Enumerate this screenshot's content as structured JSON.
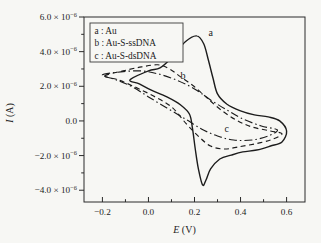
{
  "colors": {
    "ink": "#1c1c1c",
    "frame": "#2a2a2a",
    "background": "#f7f7f4",
    "legend_border": "#3a3a3a"
  },
  "chart_data": {
    "type": "line",
    "subtype": "cyclic-voltammogram",
    "title": "",
    "xlabel": {
      "var": "E",
      "unit": " (V)"
    },
    "ylabel": {
      "var": "I",
      "unit": " (A)"
    },
    "grid": false,
    "series_value_units": "1e-6 A",
    "xlim": [
      -0.28,
      0.68
    ],
    "ylim": [
      -4.68,
      6.0
    ],
    "x_ticks": {
      "values": [
        -0.2,
        0.0,
        0.2,
        0.4,
        0.6
      ],
      "labels": [
        "−0.2",
        "0.0",
        "0.2",
        "0.4",
        "0.6"
      ],
      "minor": [
        -0.1,
        0.1,
        0.3,
        0.5
      ]
    },
    "y_ticks": {
      "values": [
        6,
        4,
        2,
        0,
        -2,
        -4
      ],
      "labels": [
        "6.0 × 10^−6",
        "4.0 × 10^−6",
        "2.0 × 10^−6",
        "0.0",
        "−2.0 × 10^−6",
        "−4.0 × 10^−6"
      ],
      "minor": [
        5,
        3,
        1,
        -1,
        -3
      ]
    },
    "legend": {
      "position": "upper-left",
      "entries": [
        {
          "key": "a",
          "label": "a : Au"
        },
        {
          "key": "b",
          "label": "b : Au-S-ssDNA"
        },
        {
          "key": "c",
          "label": "c : Au-S-dsDNA"
        }
      ]
    },
    "annotations": [
      {
        "text": "a",
        "x": 0.27,
        "y": 5.1
      },
      {
        "text": "b",
        "x": 0.15,
        "y": 2.62
      },
      {
        "text": "c",
        "x": 0.34,
        "y": -0.45
      }
    ],
    "series": [
      {
        "name": "a",
        "label": "Au",
        "style": "solid",
        "dash": "",
        "width": 1.4,
        "closed": true,
        "points": [
          [
            -0.08,
            2.37
          ],
          [
            0.0,
            2.89
          ],
          [
            0.05,
            3.06
          ],
          [
            0.1,
            3.64
          ],
          [
            0.16,
            4.57
          ],
          [
            0.21,
            4.91
          ],
          [
            0.24,
            4.45
          ],
          [
            0.26,
            3.53
          ],
          [
            0.28,
            2.49
          ],
          [
            0.3,
            1.56
          ],
          [
            0.34,
            0.98
          ],
          [
            0.4,
            0.58
          ],
          [
            0.46,
            0.35
          ],
          [
            0.52,
            0.23
          ],
          [
            0.57,
            0.0
          ],
          [
            0.6,
            -0.58
          ],
          [
            0.58,
            -1.21
          ],
          [
            0.53,
            -1.45
          ],
          [
            0.47,
            -1.68
          ],
          [
            0.41,
            -1.79
          ],
          [
            0.36,
            -1.97
          ],
          [
            0.31,
            -2.2
          ],
          [
            0.27,
            -2.77
          ],
          [
            0.25,
            -3.41
          ],
          [
            0.235,
            -3.7
          ],
          [
            0.217,
            -2.77
          ],
          [
            0.204,
            -1.68
          ],
          [
            0.191,
            -0.4
          ],
          [
            0.178,
            0.4
          ],
          [
            0.14,
            0.92
          ],
          [
            0.08,
            1.39
          ],
          [
            0.01,
            1.79
          ],
          [
            -0.04,
            2.14
          ]
        ]
      },
      {
        "name": "b",
        "label": "Au-S-ssDNA",
        "style": "dashed",
        "dash": "5 3.5",
        "width": 1.15,
        "closed": true,
        "points": [
          [
            -0.19,
            2.6
          ],
          [
            -0.11,
            2.89
          ],
          [
            -0.03,
            3.12
          ],
          [
            0.04,
            3.24
          ],
          [
            0.09,
            3.01
          ],
          [
            0.14,
            2.54
          ],
          [
            0.2,
            1.97
          ],
          [
            0.25,
            1.39
          ],
          [
            0.31,
            0.69
          ],
          [
            0.38,
            0.06
          ],
          [
            0.45,
            -0.35
          ],
          [
            0.53,
            -0.58
          ],
          [
            0.58,
            -0.75
          ],
          [
            0.53,
            -1.1
          ],
          [
            0.46,
            -1.33
          ],
          [
            0.39,
            -1.5
          ],
          [
            0.33,
            -1.62
          ],
          [
            0.27,
            -1.45
          ],
          [
            0.22,
            -0.92
          ],
          [
            0.165,
            -0.17
          ],
          [
            0.1,
            0.81
          ],
          [
            0.02,
            1.45
          ],
          [
            -0.06,
            1.97
          ],
          [
            -0.13,
            2.37
          ]
        ]
      },
      {
        "name": "c",
        "label": "Au-S-dsDNA",
        "style": "dash-dot",
        "dash": "8 3 1.5 3",
        "width": 1.15,
        "closed": true,
        "points": [
          [
            -0.2,
            2.66
          ],
          [
            -0.12,
            2.83
          ],
          [
            -0.035,
            2.89
          ],
          [
            0.04,
            2.72
          ],
          [
            0.12,
            2.37
          ],
          [
            0.2,
            1.85
          ],
          [
            0.27,
            1.21
          ],
          [
            0.34,
            0.64
          ],
          [
            0.41,
            0.12
          ],
          [
            0.49,
            -0.29
          ],
          [
            0.56,
            -0.52
          ],
          [
            0.52,
            -0.87
          ],
          [
            0.45,
            -1.1
          ],
          [
            0.37,
            -1.1
          ],
          [
            0.3,
            -0.87
          ],
          [
            0.23,
            -0.46
          ],
          [
            0.16,
            0.12
          ],
          [
            0.08,
            0.75
          ],
          [
            0.0,
            1.39
          ],
          [
            -0.07,
            1.97
          ],
          [
            -0.14,
            2.37
          ]
        ]
      }
    ]
  }
}
